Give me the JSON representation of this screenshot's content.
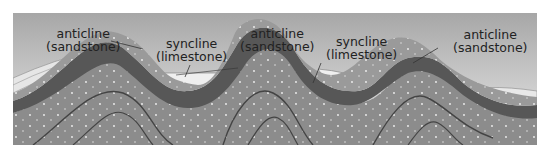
{
  "diagram": {
    "type": "geological cross-section",
    "labels": [
      {
        "id": "anticline-1",
        "line1": "anticline",
        "line2": "(sandstone)"
      },
      {
        "id": "syncline-1",
        "line1": "syncline",
        "line2": "(limestone)"
      },
      {
        "id": "anticline-2",
        "line1": "anticline",
        "line2": "(sandstone)"
      },
      {
        "id": "syncline-2",
        "line1": "syncline",
        "line2": "(limestone)"
      },
      {
        "id": "anticline-3",
        "line1": "anticline",
        "line2": "(sandstone)"
      }
    ],
    "colors": {
      "sky_top": "#a9a9a9",
      "sky_bottom": "#e9e9e9",
      "limestone": "#ececec",
      "sandstone": "#9b9b9b",
      "dark_layer": "#555555",
      "mid_layer": "#8a8a8a",
      "deep_layer": "#7a7a7a"
    }
  }
}
